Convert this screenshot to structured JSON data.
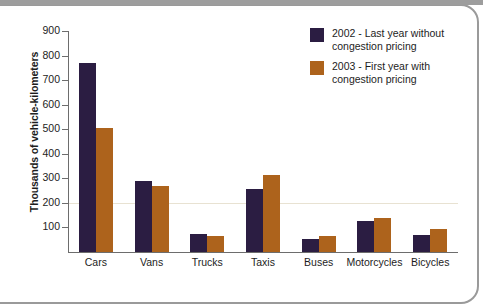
{
  "chart_data": {
    "type": "bar",
    "title": "",
    "subtitle": "",
    "xlabel": "",
    "ylabel": "Thousands of vehicle-kilometers",
    "categories": [
      "Cars",
      "Vans",
      "Trucks",
      "Taxis",
      "Buses",
      "Motorcycles",
      "Bicycles"
    ],
    "series": [
      {
        "name": "2002 - Last year without congestion pricing",
        "color": "#2b1d42",
        "values": [
          770,
          288,
          72,
          255,
          52,
          128,
          70
        ]
      },
      {
        "name": "2003 - First year with congestion pricing",
        "color": "#ad631c",
        "values": [
          505,
          268,
          65,
          312,
          65,
          138,
          93
        ]
      }
    ],
    "ylim": [
      0,
      900
    ],
    "ytick_values": [
      900,
      800,
      700,
      600,
      500,
      400,
      300,
      200,
      100
    ],
    "ytick_labels": [
      "900",
      "800",
      "700",
      "600",
      "500",
      "400",
      "300",
      "200",
      "100"
    ],
    "grid": true,
    "gridline_values": [
      200
    ],
    "legend_position": "top-right"
  },
  "legend": {
    "entries": [
      {
        "line1": "2002 - Last year without",
        "line2": "congestion pricing",
        "swatch": "#2b1d42"
      },
      {
        "line1": "2003 - First year with",
        "line2": "congestion pricing",
        "swatch": "#ad631c"
      }
    ]
  },
  "axes": {
    "y_title": "Thousands of vehicle-kilometers"
  },
  "theme": {
    "background": "#ffffff",
    "axis_color": "#6d6d6d",
    "grid_color": "#e8e2d2",
    "text_color": "#1d1d1d",
    "page_border": "#9a9a9a",
    "series_1_color": "#2b1d42",
    "series_2_color": "#ad631c"
  }
}
